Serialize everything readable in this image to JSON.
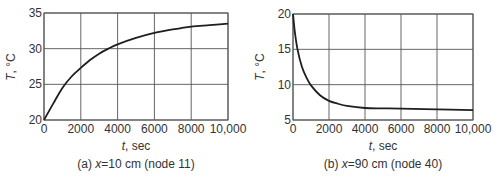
{
  "chart_data": [
    {
      "type": "line",
      "title": "",
      "caption": "(a) x=10 cm (node 11)",
      "caption_prefix": "(a)",
      "caption_var": "x",
      "caption_rest": "=10 cm (node 11)",
      "xlabel": "t, sec",
      "xlabel_var": "t",
      "xlabel_unit": ", sec",
      "ylabel": "T, °C",
      "ylabel_var": "T",
      "ylabel_unit": ", °C",
      "xlim": [
        0,
        10000
      ],
      "ylim": [
        20,
        35
      ],
      "xticks": [
        0,
        2000,
        4000,
        6000,
        8000,
        10000
      ],
      "xtick_labels": [
        "0",
        "2000",
        "4000",
        "6000",
        "8000",
        "10,000"
      ],
      "yticks": [
        20,
        25,
        30,
        35
      ],
      "ytick_labels": [
        "20",
        "25",
        "30",
        "35"
      ],
      "grid": true,
      "legend": null,
      "series": [
        {
          "name": "T at x=10 cm",
          "x": [
            0,
            500,
            1000,
            1500,
            2000,
            2500,
            3000,
            3500,
            4000,
            5000,
            6000,
            7000,
            8000,
            9000,
            10000
          ],
          "y": [
            20,
            22.3,
            24.5,
            26.1,
            27.3,
            28.4,
            29.3,
            30.0,
            30.6,
            31.5,
            32.2,
            32.7,
            33.1,
            33.3,
            33.5
          ]
        }
      ]
    },
    {
      "type": "line",
      "title": "",
      "caption": "(b) x=90 cm (node 40)",
      "caption_prefix": "(b)",
      "caption_var": "x",
      "caption_rest": "=90 cm (node 40)",
      "xlabel": "t, sec",
      "xlabel_var": "t",
      "xlabel_unit": ", sec",
      "ylabel": "T, °C",
      "ylabel_var": "T",
      "ylabel_unit": ", °C",
      "xlim": [
        0,
        10000
      ],
      "ylim": [
        5,
        20
      ],
      "xticks": [
        0,
        2000,
        4000,
        6000,
        8000,
        10000
      ],
      "xtick_labels": [
        "0",
        "2000",
        "4000",
        "6000",
        "8000",
        "10,000"
      ],
      "yticks": [
        5,
        10,
        15,
        20
      ],
      "ytick_labels": [
        "5",
        "10",
        "15",
        "20"
      ],
      "grid": true,
      "legend": null,
      "series": [
        {
          "name": "T at x=90 cm",
          "x": [
            0,
            100,
            250,
            500,
            750,
            1000,
            1500,
            2000,
            2500,
            3000,
            4000,
            5000,
            6000,
            8000,
            10000
          ],
          "y": [
            20,
            17.5,
            15.0,
            12.5,
            11.0,
            9.9,
            8.5,
            7.7,
            7.3,
            7.0,
            6.7,
            6.65,
            6.6,
            6.5,
            6.4
          ]
        }
      ]
    }
  ],
  "colors": {
    "curve": "#1e1e1e",
    "grid": "#555555",
    "text": "#333333",
    "background": "#ffffff"
  }
}
